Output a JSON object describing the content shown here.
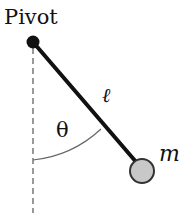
{
  "diagram": {
    "labels": {
      "pivot": "Pivot",
      "length": "ℓ",
      "angle": "θ",
      "mass": "m"
    },
    "colors": {
      "line": "#111111",
      "dashed": "#555555",
      "arc": "#666666",
      "bob_fill": "#c8c8c8",
      "bob_stroke": "#333333"
    }
  }
}
